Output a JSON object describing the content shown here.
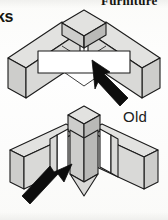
{
  "figure": {
    "kind": "furniture-joint-illustration",
    "header_right": "Furniture",
    "header_left": "ks",
    "label_old": "Old",
    "colors": {
      "outline": "#1b1b1b",
      "panel_top": "#e2e2e0",
      "panel_side": "#cdcdcb",
      "panel_front": "#d9d9d7",
      "panel_shadow": "#a9a9a7",
      "bracket_fill": "#ffffff",
      "arrow": "#0d0d0d",
      "background": "#fdfdfb"
    },
    "panels": [
      {
        "name": "top-diagram",
        "description": "Corner joint seen from above: two boards meeting at a square corner post, with a flat white rectangular connector plate laid across the joint.",
        "parts": [
          "left-board",
          "right-board",
          "corner-post-cube",
          "white-connector-plate"
        ],
        "callout_arrow": {
          "name": "arrow-to-connector-plate",
          "direction": "up-left",
          "target": "white-connector-plate"
        }
      },
      {
        "name": "bottom-diagram",
        "description": "Older corner joint: two boards slotted into grooves of a vertical corner post.",
        "label": "Old",
        "parts": [
          "left-board",
          "right-board",
          "grooved-corner-post",
          "groove-slots"
        ],
        "callout_arrow": {
          "name": "arrow-to-groove-joint",
          "direction": "up-right",
          "target": "grooved-corner-post"
        }
      }
    ]
  }
}
